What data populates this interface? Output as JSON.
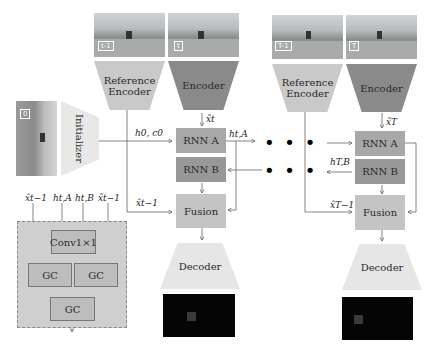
{
  "figure": {
    "colors": {
      "reference_encoder": "#c9c9c9",
      "encoder": "#8a8a8a",
      "rnn": "#a8a8a8",
      "fusion": "#c4c4c4",
      "decoder": "#e6e6e6",
      "initializer": "#e8e8e8",
      "gc_panel": "#cfcfcf",
      "arrow": "#555555"
    },
    "initializer": {
      "label": "Initializer",
      "frame_tag": "0"
    },
    "step_t": {
      "ref_frame_tag": "t-1",
      "cur_frame_tag": "t",
      "reference_encoder_label": "Reference\nEncoder",
      "reference_encoder_line1": "Reference",
      "reference_encoder_line2": "Encoder",
      "encoder_label": "Encoder",
      "rnn_a_label": "RNN A",
      "rnn_b_label": "RNN B",
      "fusion_label": "Fusion",
      "decoder_label": "Decoder",
      "x_t_label": "x̃t",
      "x_prev_label": "x̂t−1",
      "h0_label": "h0, c0",
      "h_tA_label": "ht,A"
    },
    "step_T": {
      "ref_frame_tag": "T-1",
      "cur_frame_tag": "T",
      "reference_encoder_line1": "Reference",
      "reference_encoder_line2": "Encoder",
      "encoder_label": "Encoder",
      "rnn_a_label": "RNN A",
      "rnn_b_label": "RNN B",
      "fusion_label": "Fusion",
      "decoder_label": "Decoder",
      "x_T_label": "x̃T",
      "x_prev_label": "x̂T−1",
      "h_TB_label": "hT,B"
    },
    "ellipsis": "• • •",
    "fusion_detail": {
      "inputs": [
        "x̂t−1",
        "ht,A",
        "ht,B",
        "x̃t−1"
      ],
      "conv_label": "Conv1×1",
      "gc_left": "GC",
      "gc_right": "GC",
      "gc_bottom": "GC"
    }
  }
}
